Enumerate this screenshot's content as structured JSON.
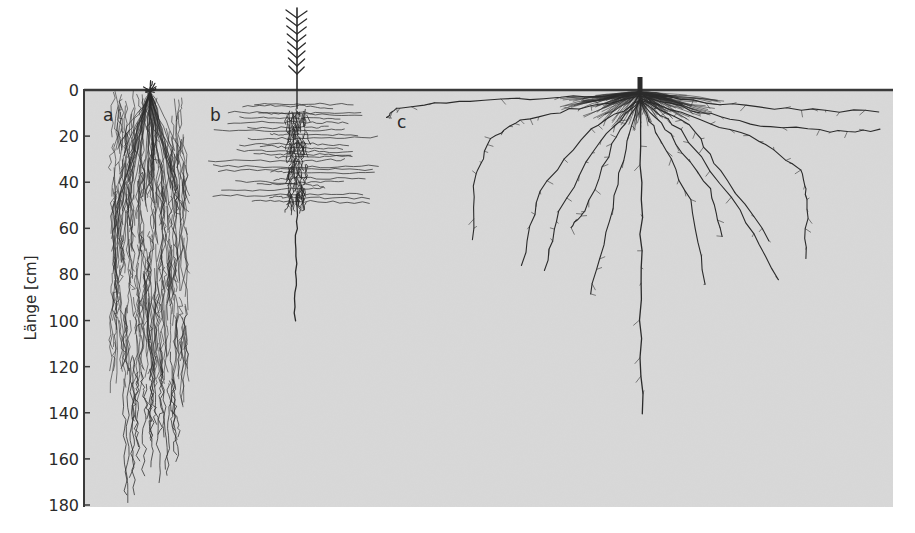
{
  "figure": {
    "type": "root-system-diagram",
    "y_axis": {
      "label": "Länge [cm]",
      "ticks": [
        "0",
        "20",
        "40",
        "60",
        "80",
        "100",
        "120",
        "140",
        "160",
        "180"
      ],
      "min": 0,
      "max": 180,
      "step": 20
    },
    "panels": [
      {
        "letter": "a",
        "description": "fibrous grass root system",
        "max_depth_cm": 180
      },
      {
        "letter": "b",
        "description": "conifer seedling with lateral roots and taproot",
        "max_depth_cm": 100
      },
      {
        "letter": "c",
        "description": "broad spreading lateral roots with deep taproot",
        "max_depth_cm": 140
      }
    ],
    "colors": {
      "soil": "#d9d9d9",
      "ink": "#2b2b2b",
      "surface_line": "#3a3a3a",
      "background": "#ffffff"
    }
  }
}
